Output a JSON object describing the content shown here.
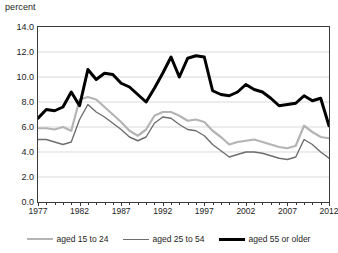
{
  "chart_data": {
    "type": "line",
    "title": "",
    "xlabel": "",
    "ylabel": "percent",
    "ylim": [
      0.0,
      14.0
    ],
    "yticks": [
      "0.0",
      "2.0",
      "4.0",
      "6.0",
      "8.0",
      "10.0",
      "12.0",
      "14.0"
    ],
    "ytick_values": [
      0.0,
      2.0,
      4.0,
      6.0,
      8.0,
      10.0,
      12.0,
      14.0
    ],
    "xlim": [
      1977,
      2012
    ],
    "xticks": [
      "1977",
      "1982",
      "1987",
      "1992",
      "1997",
      "2002",
      "2007",
      "2012"
    ],
    "xtick_values": [
      1977,
      1982,
      1987,
      1992,
      1997,
      2002,
      2007,
      2012
    ],
    "grid": true,
    "legend_position": "bottom",
    "x": [
      1977,
      1978,
      1979,
      1980,
      1981,
      1982,
      1983,
      1984,
      1985,
      1986,
      1987,
      1988,
      1989,
      1990,
      1991,
      1992,
      1993,
      1994,
      1995,
      1996,
      1997,
      1998,
      1999,
      2000,
      2001,
      2002,
      2003,
      2004,
      2005,
      2006,
      2007,
      2008,
      2009,
      2010,
      2011,
      2012
    ],
    "series": [
      {
        "name": "aged 15 to 24",
        "color": "#b4b4b4",
        "width": 2.2,
        "values": [
          5.9,
          5.9,
          5.8,
          6.0,
          5.7,
          8.2,
          8.4,
          8.2,
          7.6,
          7.0,
          6.4,
          5.7,
          5.3,
          5.8,
          6.9,
          7.2,
          7.2,
          6.9,
          6.5,
          6.6,
          6.4,
          5.7,
          5.2,
          4.6,
          4.8,
          4.9,
          5.0,
          4.8,
          4.6,
          4.4,
          4.3,
          4.5,
          6.1,
          5.6,
          5.2,
          5.1
        ]
      },
      {
        "name": "aged 25 to 54",
        "color": "#6e6e6e",
        "width": 1.4,
        "values": [
          5.0,
          5.0,
          4.8,
          4.6,
          4.8,
          6.6,
          7.8,
          7.2,
          6.8,
          6.3,
          5.8,
          5.2,
          4.9,
          5.2,
          6.3,
          6.8,
          6.7,
          6.2,
          5.8,
          5.7,
          5.3,
          4.6,
          4.1,
          3.6,
          3.8,
          4.0,
          4.0,
          3.9,
          3.7,
          3.5,
          3.4,
          3.6,
          5.0,
          4.6,
          4.0,
          3.5
        ]
      },
      {
        "name": "aged 55 or older",
        "color": "#000000",
        "width": 3.0,
        "values": [
          6.7,
          7.4,
          7.3,
          7.6,
          8.8,
          7.7,
          10.6,
          9.8,
          10.3,
          10.2,
          9.5,
          9.2,
          8.6,
          8.0,
          9.1,
          10.3,
          11.6,
          10.0,
          11.5,
          11.7,
          11.6,
          8.9,
          8.6,
          8.5,
          8.8,
          9.4,
          9.0,
          8.8,
          8.3,
          7.7,
          7.8,
          7.9,
          8.5,
          8.1,
          8.3,
          6.1
        ]
      }
    ]
  },
  "legend": {
    "items": [
      {
        "label": "aged 15 to 24"
      },
      {
        "label": "aged 25 to 54"
      },
      {
        "label": "aged 55 or older"
      }
    ]
  }
}
